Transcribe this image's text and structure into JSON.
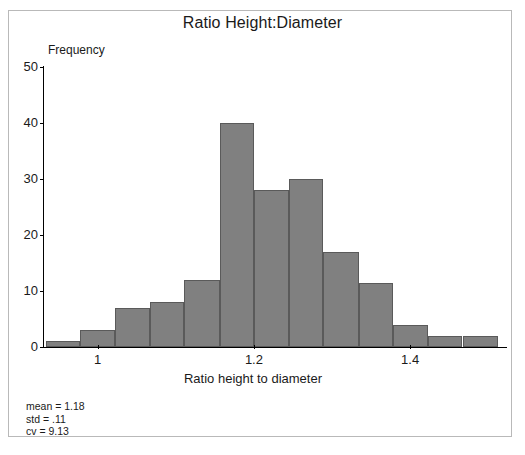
{
  "chart_data": {
    "type": "bar",
    "title": "Ratio Height:Diameter",
    "xlabel": "Ratio height to diameter",
    "ylabel": "Frequency",
    "xlim": [
      0.93,
      1.515
    ],
    "ylim": [
      0,
      50
    ],
    "grid": false,
    "legend": null,
    "bin_width": 0.0446,
    "xticks": [
      "1",
      "1.2",
      "1.4"
    ],
    "xtick_values": [
      1,
      1.2,
      1.4
    ],
    "yticks": [
      "0",
      "10",
      "20",
      "30",
      "40",
      "50"
    ],
    "ytick_values": [
      0,
      10,
      20,
      30,
      40,
      50
    ],
    "bins": [
      {
        "left": 0.934,
        "right": 0.978,
        "value": 1
      },
      {
        "left": 0.978,
        "right": 1.022,
        "value": 3
      },
      {
        "left": 1.022,
        "right": 1.067,
        "value": 7
      },
      {
        "left": 1.067,
        "right": 1.111,
        "value": 8
      },
      {
        "left": 1.111,
        "right": 1.156,
        "value": 12
      },
      {
        "left": 1.156,
        "right": 1.2,
        "value": 40
      },
      {
        "left": 1.2,
        "right": 1.245,
        "value": 28
      },
      {
        "left": 1.245,
        "right": 1.289,
        "value": 30
      },
      {
        "left": 1.289,
        "right": 1.334,
        "value": 17
      },
      {
        "left": 1.334,
        "right": 1.378,
        "value": 11.5
      },
      {
        "left": 1.378,
        "right": 1.423,
        "value": 4
      },
      {
        "left": 1.423,
        "right": 1.467,
        "value": 2
      },
      {
        "left": 1.467,
        "right": 1.512,
        "value": 2
      }
    ],
    "values": [
      1,
      3,
      7,
      8,
      12,
      40,
      28,
      30,
      17,
      11.5,
      4,
      2,
      2
    ],
    "categories": [
      "0.93-0.98",
      "0.98-1.02",
      "1.02-1.07",
      "1.07-1.11",
      "1.11-1.16",
      "1.16-1.20",
      "1.20-1.24",
      "1.24-1.29",
      "1.29-1.33",
      "1.33-1.38",
      "1.38-1.42",
      "1.42-1.47",
      "1.47-1.51"
    ],
    "annotations": {
      "mean": "mean = 1.18",
      "std": "std = .11",
      "cv": "cv = 9.13"
    },
    "colors": {
      "bar_fill": "#808080",
      "bar_edge": "#5a5a5a",
      "axis": "#000000",
      "text": "#1a1a1a",
      "frame": "#b9b9b9",
      "background": "#ffffff"
    }
  }
}
